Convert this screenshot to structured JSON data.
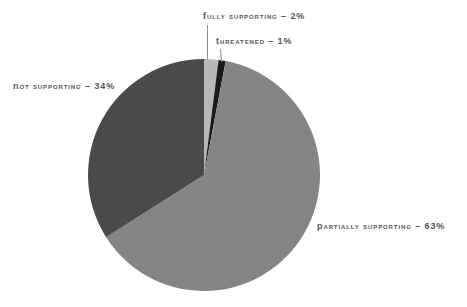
{
  "chart_data": {
    "type": "pie",
    "title": "",
    "subtitle": "",
    "xlabel": "",
    "ylabel": "",
    "legend_position": "none",
    "grid": false,
    "label_style": "outside-with-leader-lines",
    "start_angle_deg": 0,
    "direction": "clockwise",
    "categories": [
      "Fully Supporting",
      "Threatened",
      "Partially Supporting",
      "Not Supporting"
    ],
    "values": [
      2,
      1,
      63,
      34
    ],
    "value_unit": "%",
    "slices": [
      {
        "label": "Fully Supporting",
        "value": 2,
        "display": "Fully Supporting – 2%",
        "color": "#b8b8b8"
      },
      {
        "label": "Threatened",
        "value": 1,
        "display": "Threatened – 1%",
        "color": "#1a1a1a"
      },
      {
        "label": "Partially Supporting",
        "value": 63,
        "display": "Partially Supporting – 63%",
        "color": "#858585"
      },
      {
        "label": "Not Supporting",
        "value": 34,
        "display": "Not Supporting – 34%",
        "color": "#4a4a4a"
      }
    ],
    "total": 100
  },
  "labels": {
    "fully_supporting": "Fully Supporting – 2%",
    "threatened": "Threatened – 1%",
    "not_supporting": "Not Supporting – 34%",
    "partially_supporting": "Partially Supporting – 63%"
  },
  "colors": {
    "background": "#ffffff",
    "text": "#555555",
    "leader_line": "#8a8a8a",
    "fully_supporting": "#b8b8b8",
    "threatened": "#1a1a1a",
    "partially_supporting": "#858585",
    "not_supporting": "#4a4a4a"
  }
}
